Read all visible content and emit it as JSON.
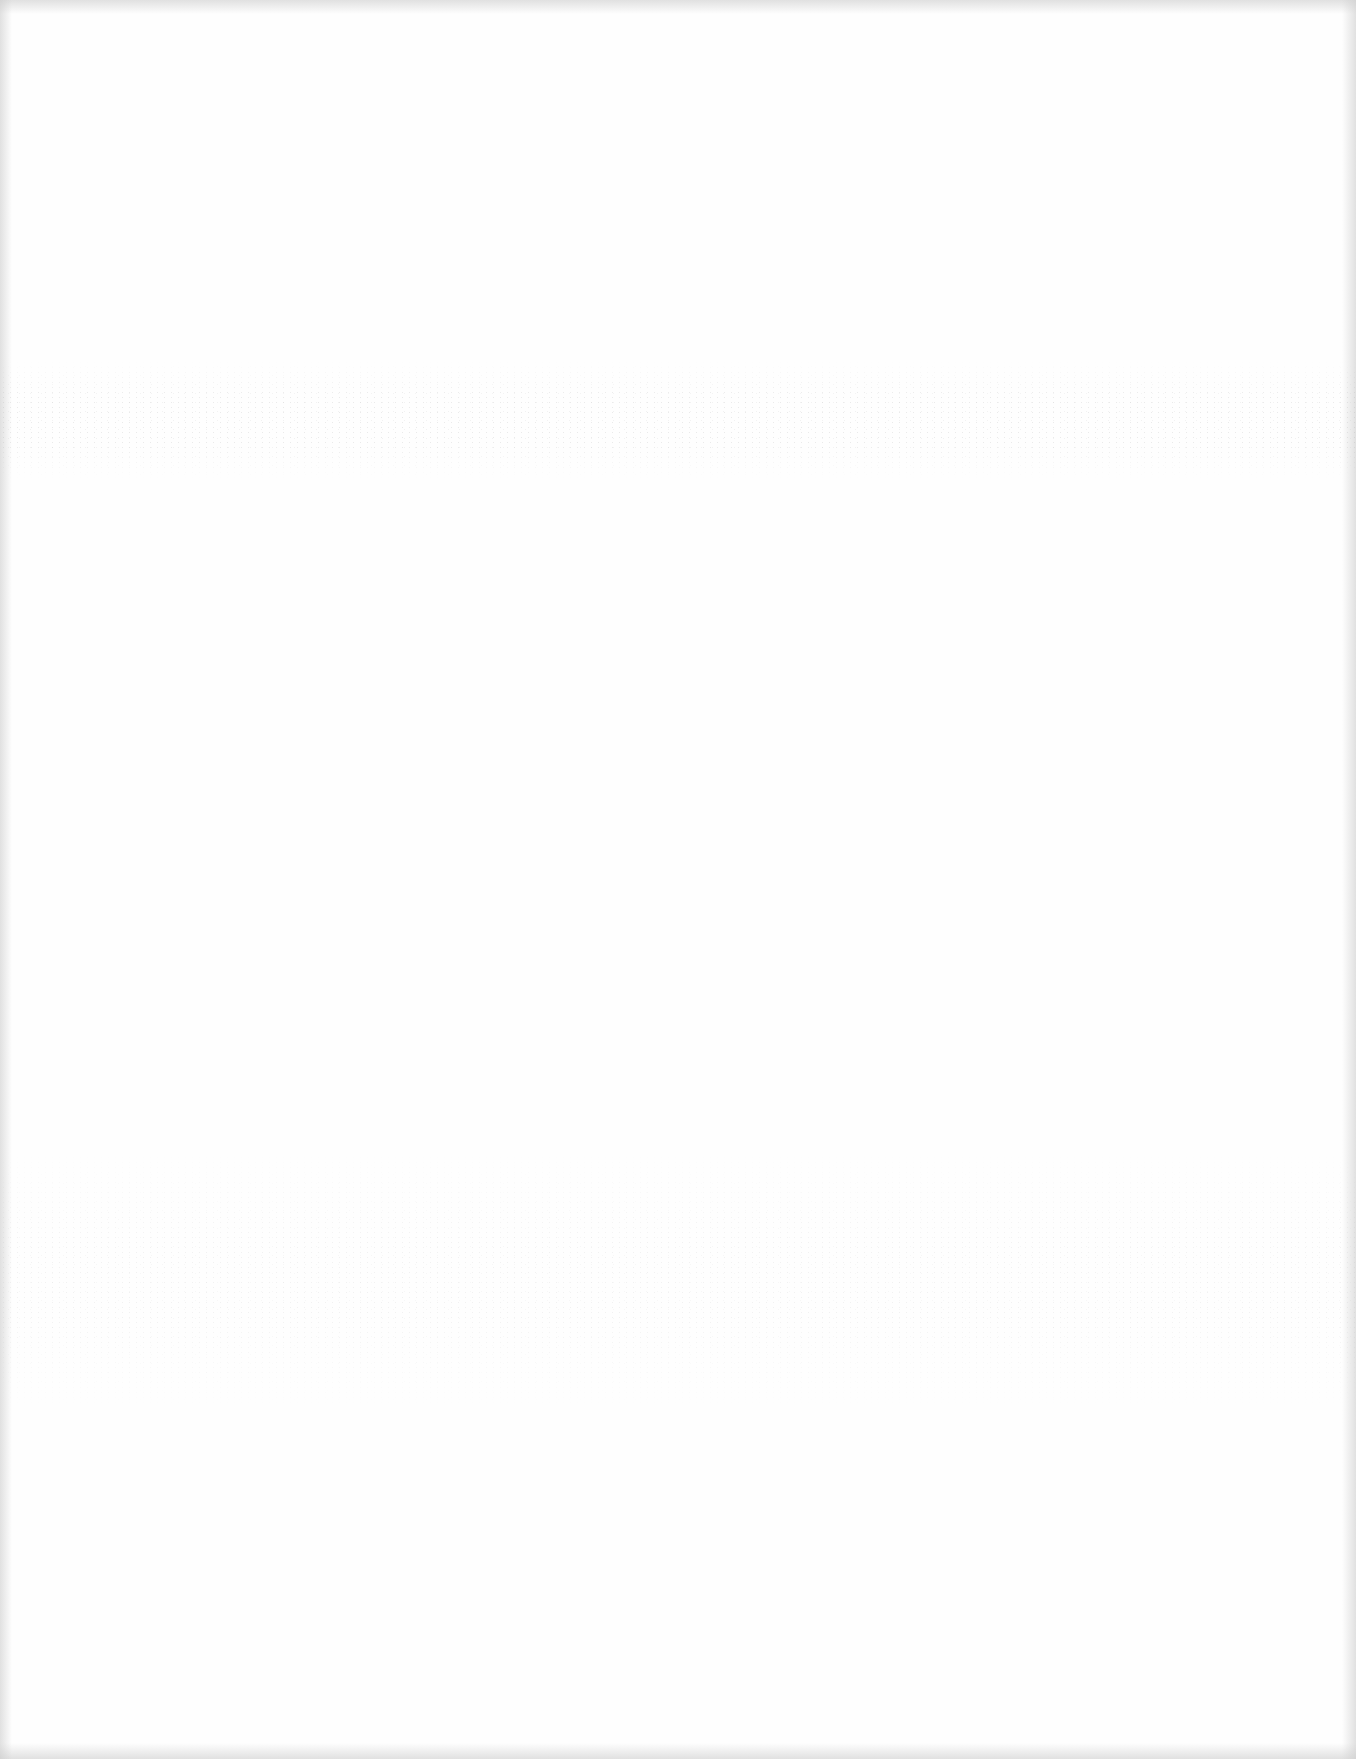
{
  "page": {
    "type": "blank-scanned-page",
    "background_color": "#fefefe",
    "edge_tone": "#cdcdcd",
    "text_content": [],
    "artifacts": [
      {
        "kind": "speckle-noise-band",
        "approx_y_range": [
          360,
          480
        ]
      },
      {
        "kind": "speckle-noise-band",
        "approx_y_range": [
          1150,
          1410
        ]
      },
      {
        "kind": "darkened-scan-edges",
        "sides": [
          "top",
          "bottom",
          "left",
          "right"
        ]
      }
    ]
  }
}
